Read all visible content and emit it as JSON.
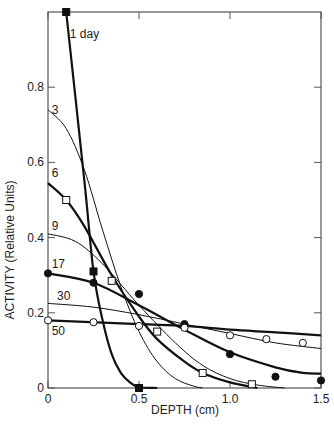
{
  "chart_data": {
    "type": "line",
    "title": "",
    "xlabel": "DEPTH (cm)",
    "ylabel": "ACTIVITY (Relative Units)",
    "xlim": [
      0,
      1.5
    ],
    "ylim": [
      0,
      1.0
    ],
    "xticks": [
      0,
      0.5,
      1.0,
      1.5
    ],
    "xtick_labels": [
      "0",
      "0.5",
      "1.0",
      "1.5"
    ],
    "yticks": [
      0,
      0.2,
      0.4,
      0.6,
      0.8
    ],
    "ytick_labels": [
      "0",
      "0.2",
      "0.4",
      "0.6",
      "0.8"
    ],
    "grid": false,
    "legend": "inline curve labels",
    "series": [
      {
        "name": "1 day",
        "label": "1 day",
        "weight": "heavy",
        "curve": [
          [
            0.1,
            1.0
          ],
          [
            0.2,
            0.55
          ],
          [
            0.25,
            0.31
          ],
          [
            0.3,
            0.18
          ],
          [
            0.35,
            0.09
          ],
          [
            0.4,
            0.04
          ],
          [
            0.45,
            0.015
          ],
          [
            0.5,
            0.002
          ],
          [
            0.6,
            0.0
          ]
        ],
        "markers": {
          "shape": "square",
          "fill": "filled",
          "points": [
            [
              0.1,
              1.0
            ],
            [
              0.25,
              0.31
            ],
            [
              0.5,
              0.0
            ]
          ]
        },
        "label_pos": [
          0.12,
          0.93
        ]
      },
      {
        "name": "3 days",
        "label": "3",
        "weight": "light",
        "curve": [
          [
            0.0,
            0.74
          ],
          [
            0.1,
            0.69
          ],
          [
            0.2,
            0.58
          ],
          [
            0.3,
            0.42
          ],
          [
            0.4,
            0.27
          ],
          [
            0.5,
            0.15
          ],
          [
            0.6,
            0.07
          ],
          [
            0.7,
            0.025
          ],
          [
            0.8,
            0.005
          ],
          [
            0.85,
            0.0
          ]
        ],
        "markers": null,
        "label_pos": [
          0.02,
          0.73
        ]
      },
      {
        "name": "6 days",
        "label": "6",
        "weight": "heavy",
        "curve": [
          [
            0.0,
            0.545
          ],
          [
            0.1,
            0.5
          ],
          [
            0.2,
            0.43
          ],
          [
            0.35,
            0.3
          ],
          [
            0.5,
            0.19
          ],
          [
            0.6,
            0.13
          ],
          [
            0.75,
            0.07
          ],
          [
            0.85,
            0.04
          ],
          [
            1.0,
            0.015
          ],
          [
            1.15,
            0.0
          ]
        ],
        "markers": {
          "shape": "square",
          "fill": "open",
          "points": [
            [
              0.1,
              0.5
            ],
            [
              0.35,
              0.285
            ],
            [
              0.6,
              0.15
            ],
            [
              0.85,
              0.04
            ],
            [
              1.12,
              0.01
            ]
          ]
        },
        "label_pos": [
          0.02,
          0.56
        ]
      },
      {
        "name": "9 days",
        "label": "9",
        "weight": "light",
        "curve": [
          [
            0.0,
            0.41
          ],
          [
            0.15,
            0.39
          ],
          [
            0.3,
            0.33
          ],
          [
            0.5,
            0.22
          ],
          [
            0.7,
            0.12
          ],
          [
            0.85,
            0.06
          ],
          [
            1.0,
            0.025
          ],
          [
            1.15,
            0.008
          ],
          [
            1.3,
            0.0
          ]
        ],
        "markers": null,
        "label_pos": [
          0.02,
          0.42
        ]
      },
      {
        "name": "17 days",
        "label": "17",
        "weight": "heavy",
        "curve": [
          [
            0.0,
            0.305
          ],
          [
            0.25,
            0.28
          ],
          [
            0.5,
            0.22
          ],
          [
            0.75,
            0.155
          ],
          [
            1.0,
            0.095
          ],
          [
            1.25,
            0.055
          ],
          [
            1.4,
            0.04
          ],
          [
            1.5,
            0.038
          ]
        ],
        "markers": {
          "shape": "circle",
          "fill": "filled",
          "points": [
            [
              0.0,
              0.305
            ],
            [
              0.25,
              0.28
            ],
            [
              0.5,
              0.25
            ],
            [
              0.75,
              0.17
            ],
            [
              1.0,
              0.09
            ],
            [
              1.25,
              0.03
            ],
            [
              1.5,
              0.02
            ]
          ]
        },
        "label_pos": [
          0.02,
          0.32
        ]
      },
      {
        "name": "30 days",
        "label": "30",
        "weight": "light",
        "curve": [
          [
            0.0,
            0.225
          ],
          [
            0.25,
            0.215
          ],
          [
            0.5,
            0.195
          ],
          [
            0.75,
            0.17
          ],
          [
            1.0,
            0.145
          ],
          [
            1.25,
            0.12
          ],
          [
            1.5,
            0.105
          ]
        ],
        "markers": null,
        "label_pos": [
          0.05,
          0.235
        ]
      },
      {
        "name": "50 days",
        "label": "50",
        "weight": "heavy",
        "curve": [
          [
            0.0,
            0.18
          ],
          [
            0.5,
            0.17
          ],
          [
            0.75,
            0.165
          ],
          [
            1.0,
            0.155
          ],
          [
            1.25,
            0.148
          ],
          [
            1.5,
            0.14
          ]
        ],
        "markers": {
          "shape": "circle",
          "fill": "open",
          "points": [
            [
              0.0,
              0.18
            ],
            [
              0.25,
              0.175
            ],
            [
              0.5,
              0.165
            ],
            [
              0.75,
              0.16
            ],
            [
              1.0,
              0.14
            ],
            [
              1.2,
              0.13
            ],
            [
              1.4,
              0.12
            ]
          ]
        },
        "label_pos": [
          0.02,
          0.14
        ]
      }
    ]
  }
}
